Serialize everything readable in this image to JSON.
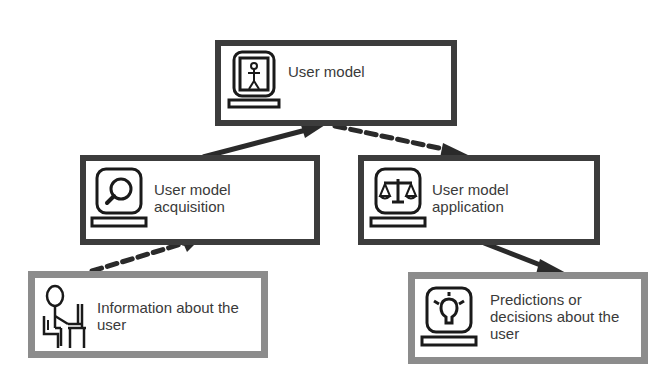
{
  "diagram": {
    "nodes": {
      "user_model": {
        "lines": [
          "User model"
        ],
        "icon": "person-in-monitor-icon",
        "border": "dark"
      },
      "acquisition": {
        "lines": [
          "User model",
          "acquisition"
        ],
        "icon": "magnifier-monitor-icon",
        "border": "dark"
      },
      "application": {
        "lines": [
          "User model",
          "application"
        ],
        "icon": "scales-monitor-icon",
        "border": "dark"
      },
      "information": {
        "lines": [
          "Information about the",
          "user"
        ],
        "icon": "person-at-computer-icon",
        "border": "light"
      },
      "predictions": {
        "lines": [
          "Predictions or",
          "decisions about the",
          "user"
        ],
        "icon": "lightbulb-monitor-icon",
        "border": "light"
      }
    },
    "edges": [
      {
        "from": "information",
        "to": "acquisition",
        "style": "dashed"
      },
      {
        "from": "acquisition",
        "to": "user_model",
        "style": "solid"
      },
      {
        "from": "user_model",
        "to": "application",
        "style": "dashed"
      },
      {
        "from": "application",
        "to": "predictions",
        "style": "solid"
      }
    ],
    "colors": {
      "dark_border": "#3c3c3c",
      "light_border": "#8c8c8c",
      "arrow": "#2a2a2a",
      "text": "#3a3a3a"
    }
  }
}
